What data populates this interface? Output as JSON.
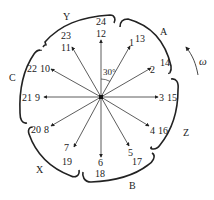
{
  "diagram": {
    "type": "slot-emf-star-diagram",
    "angle_label": "30°",
    "rotation_label": "ω",
    "center": [
      101,
      97
    ],
    "phase_belts": [
      {
        "label": "A",
        "slots": "13,1,14,2"
      },
      {
        "label": "Z",
        "slots": "3,15,4,16"
      },
      {
        "label": "B",
        "slots": "5,17,6,18"
      },
      {
        "label": "X",
        "slots": "7,19,8,20"
      },
      {
        "label": "C",
        "slots": "9,21,10,22"
      },
      {
        "label": "Y",
        "slots": "11,23,12,24"
      }
    ],
    "vectors": [
      {
        "angle_deg": 0,
        "label_inner": "12",
        "label_outer": "24"
      },
      {
        "angle_deg": 30,
        "label_inner": "1",
        "label_outer": "13"
      },
      {
        "angle_deg": 60,
        "label_inner": "2",
        "label_outer": "14"
      },
      {
        "angle_deg": 90,
        "label_inner": "3",
        "label_outer": "15"
      },
      {
        "angle_deg": 120,
        "label_inner": "4",
        "label_outer": "16"
      },
      {
        "angle_deg": 150,
        "label_inner": "5",
        "label_outer": "17"
      },
      {
        "angle_deg": 180,
        "label_inner": "6",
        "label_outer": "18"
      },
      {
        "angle_deg": 210,
        "label_inner": "7",
        "label_outer": "19"
      },
      {
        "angle_deg": 240,
        "label_inner": "8",
        "label_outer": "20"
      },
      {
        "angle_deg": 270,
        "label_inner": "9",
        "label_outer": "21"
      },
      {
        "angle_deg": 300,
        "label_inner": "10",
        "label_outer": "22"
      },
      {
        "angle_deg": 330,
        "label_inner": "11",
        "label_outer": "23"
      }
    ],
    "labels": {
      "v0_in": "12",
      "v0_out": "24",
      "v1_in": "1",
      "v1_out": "13",
      "v2_in": "2",
      "v2_out": "14",
      "v3_in": "3",
      "v3_out": "15",
      "v4_in": "4",
      "v4_out": "16",
      "v5_in": "5",
      "v5_out": "17",
      "v6_in": "6",
      "v6_out": "18",
      "v7_in": "7",
      "v7_out": "19",
      "v8_in": "8",
      "v8_out": "20",
      "v9_in": "9",
      "v9_out": "21",
      "v10_in": "10",
      "v10_out": "22",
      "v11_in": "11",
      "v11_out": "23",
      "phase_A": "A",
      "phase_Z": "Z",
      "phase_B": "B",
      "phase_X": "X",
      "phase_C": "C",
      "phase_Y": "Y"
    }
  }
}
